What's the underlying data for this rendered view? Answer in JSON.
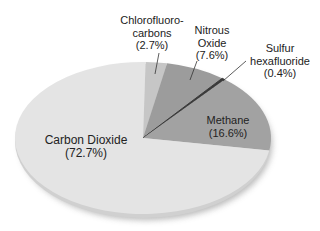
{
  "chart_data": {
    "type": "pie",
    "title": "",
    "categories": [
      "Carbon Dioxide",
      "Chlorofluorocarbons",
      "Nitrous Oxide",
      "Sulfur hexafluoride",
      "Methane"
    ],
    "values": [
      72.7,
      2.7,
      7.6,
      0.4,
      16.6
    ],
    "unit": "%",
    "colors": [
      "#e4e4e4",
      "#c6c6c6",
      "#9c9c9c",
      "#3a3a3a",
      "#a2a2a2"
    ],
    "legend": "none (direct labels)",
    "style": "3D tilted pie with shadow"
  },
  "labels": {
    "co2": {
      "line1": "Carbon Dioxide",
      "line2": "(72.7%)"
    },
    "cfc": {
      "line1": "Chlorofluoro-",
      "line2": "carbons",
      "line3": "(2.7%)"
    },
    "n2o": {
      "line1": "Nitrous",
      "line2": "Oxide",
      "line3": "(7.6%)"
    },
    "sf6": {
      "line1": "Sulfur",
      "line2": "hexafluoride",
      "line3": "(0.4%)"
    },
    "ch4": {
      "line1": "Methane",
      "line2": "(16.6%)"
    }
  }
}
